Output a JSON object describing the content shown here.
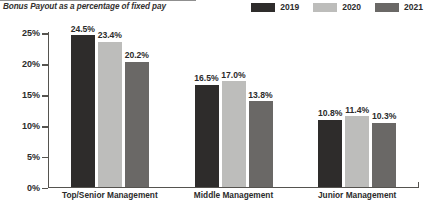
{
  "chart_data": {
    "type": "bar",
    "title": "Bonus Payout as a percentage of fixed pay",
    "xlabel": "",
    "ylabel": "",
    "ylim": [
      0,
      25
    ],
    "ytick_labels": [
      "25%",
      "20%",
      "15%",
      "10%",
      "5%",
      "0%"
    ],
    "ytick_values": [
      25,
      20,
      15,
      10,
      5,
      0
    ],
    "grid": false,
    "legend_position": "top-right",
    "categories": [
      "Top/Senior Management",
      "Middle Management",
      "Junior Management"
    ],
    "series": [
      {
        "name": "2019",
        "color": "#2e2c2b",
        "values": [
          24.5,
          16.5,
          10.8
        ],
        "labels": [
          "24.5%",
          "16.5%",
          "10.8%"
        ]
      },
      {
        "name": "2020",
        "color": "#bdbdbb",
        "values": [
          23.4,
          17.0,
          11.4
        ],
        "labels": [
          "23.4%",
          "17.0%",
          "11.4%"
        ]
      },
      {
        "name": "2021",
        "color": "#6a6866",
        "values": [
          20.2,
          13.8,
          10.3
        ],
        "labels": [
          "20.2%",
          "13.8%",
          "10.3%"
        ]
      }
    ]
  },
  "colors": {
    "axis": "#55534f",
    "text": "#2b2b2b",
    "title": "#33312f",
    "background": "#ffffff"
  }
}
